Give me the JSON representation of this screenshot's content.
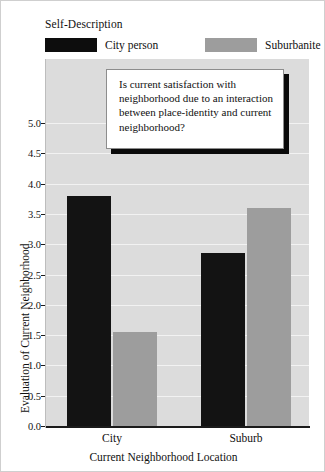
{
  "legend": {
    "title": "Self-Description",
    "items": [
      {
        "label": "City person",
        "color": "#131313"
      },
      {
        "label": "Suburbanite",
        "color": "#9d9d9d"
      }
    ]
  },
  "callout": {
    "text": "Is current satisfaction with neighborhood due to an interaction between place-identity and current neighborhood?"
  },
  "chart_data": {
    "type": "bar",
    "title": "",
    "xlabel": "Current Neighborhood Location",
    "ylabel": "Evaluation of Current Neighborhood",
    "categories": [
      "City",
      "Suburb"
    ],
    "series": [
      {
        "name": "City person",
        "color": "#131313",
        "values": [
          3.8,
          2.85
        ]
      },
      {
        "name": "Suburbanite",
        "color": "#9d9d9d",
        "values": [
          1.55,
          3.6
        ]
      }
    ],
    "ylim": [
      0.0,
      5.0
    ],
    "yticks": [
      "0.0",
      "0.5",
      "1.0",
      "1.5",
      "2.0",
      "2.5",
      "3.0",
      "3.5",
      "4.0",
      "4.5",
      "5.0"
    ],
    "ytick_values": [
      0.0,
      0.5,
      1.0,
      1.5,
      2.0,
      2.5,
      3.0,
      3.5,
      4.0,
      4.5,
      5.0
    ],
    "grid": true,
    "grid_axis": "y",
    "legend_position": "top",
    "plot_background": "#dcdcdc"
  }
}
